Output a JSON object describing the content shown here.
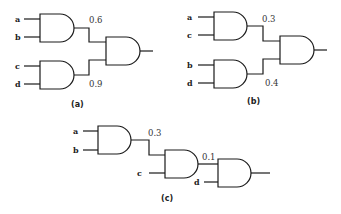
{
  "figure": {
    "type": "logic-gate-diagram",
    "gate_type": "AND",
    "panels": [
      {
        "caption": "(a)",
        "gate1_inputs": [
          "a",
          "b"
        ],
        "gate1_output_value": "0.6",
        "gate2_inputs": [
          "c",
          "d"
        ],
        "gate2_output_value": "0.9"
      },
      {
        "caption": "(b)",
        "gate1_inputs": [
          "a",
          "c"
        ],
        "gate1_output_value": "0.3",
        "gate2_inputs": [
          "b",
          "d"
        ],
        "gate2_output_value": "0.4"
      },
      {
        "caption": "(c)",
        "gate1_inputs": [
          "a",
          "b"
        ],
        "gate1_output_value": "0.3",
        "gate2_extra_input": "c",
        "gate2_output_value": "0.1",
        "gate3_extra_input": "d"
      }
    ]
  }
}
